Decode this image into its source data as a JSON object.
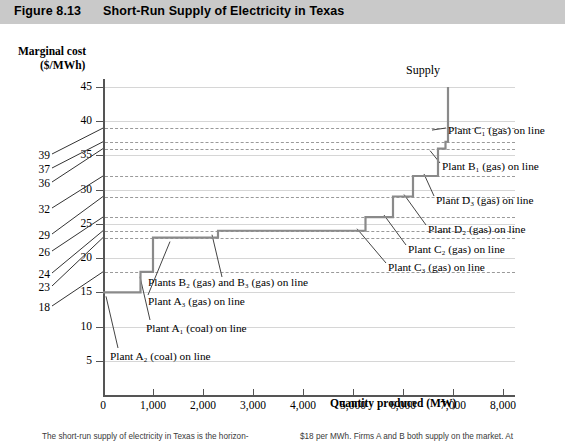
{
  "header": {
    "figure_number": "Figure 8.13",
    "title": "Short-Run Supply of Electricity in Texas"
  },
  "supply_label": "Supply",
  "caption": {
    "left": "The short-run supply of electricity in Texas is the horizon-",
    "right": "$18 per MWh. Firms A and B both supply on the market. At"
  },
  "chart_data": {
    "type": "line",
    "subtype": "step",
    "title": "Short-Run Supply of Electricity in Texas",
    "xlabel": "Quantity produced (MW)",
    "ylabel": "Marginal cost ($/MWh)",
    "xlim": [
      0,
      8000
    ],
    "ylim": [
      0,
      47
    ],
    "grid": true,
    "legend": "none",
    "x_ticks": [
      0,
      1000,
      2000,
      3000,
      4000,
      5000,
      6000,
      7000,
      8000
    ],
    "x_tick_labels": [
      "0",
      "1,000",
      "2,000",
      "3,000",
      "4,000",
      "5,000",
      "6,000",
      "7,000",
      "8,000"
    ],
    "y_ticks": [
      5,
      10,
      15,
      20,
      25,
      30,
      35,
      40,
      45
    ],
    "y_tick_labels": [
      "5",
      "10",
      "15",
      "20",
      "25",
      "30",
      "35",
      "40",
      "45"
    ],
    "y_reference_values": [
      18,
      23,
      24,
      26,
      29,
      32,
      36,
      37,
      39
    ],
    "y_reference_labels": [
      "18",
      "23",
      "24",
      "26",
      "29",
      "32",
      "36",
      "37",
      "39"
    ],
    "series": [
      {
        "name": "Supply",
        "steps": [
          {
            "q_start": 0,
            "q_end": 750,
            "price": 15
          },
          {
            "q_start": 750,
            "q_end": 1000,
            "price": 18
          },
          {
            "q_start": 1000,
            "q_end": 2300,
            "price": 23
          },
          {
            "q_start": 2300,
            "q_end": 5250,
            "price": 24
          },
          {
            "q_start": 5250,
            "q_end": 5800,
            "price": 26
          },
          {
            "q_start": 5800,
            "q_end": 6200,
            "price": 29
          },
          {
            "q_start": 6200,
            "q_end": 6700,
            "price": 32
          },
          {
            "q_start": 6700,
            "q_end": 6850,
            "price": 36
          },
          {
            "q_start": 6850,
            "q_end": 6900,
            "price": 37
          },
          {
            "q_start": 6900,
            "q_end": 6900,
            "price": 45
          }
        ]
      }
    ],
    "annotations": [
      {
        "id": "plant-a2",
        "text": "Plant A₂ (coal) on line",
        "plant": "A2",
        "fuel": "coal",
        "price": 15
      },
      {
        "id": "plant-a1",
        "text": "Plant A₁ (coal) on line",
        "plant": "A1",
        "fuel": "coal",
        "price": 18
      },
      {
        "id": "plant-a3",
        "text": "Plant A₃ (gas) on line",
        "plant": "A3",
        "fuel": "gas",
        "price": 23
      },
      {
        "id": "plant-b2-b3",
        "text": "Plants B₂ (gas) and B₃ (gas) on line",
        "plant": "B2,B3",
        "fuel": "gas",
        "price": 24
      },
      {
        "id": "plant-c3",
        "text": "Plant C₃ (gas) on line",
        "plant": "C3",
        "fuel": "gas",
        "price": 26
      },
      {
        "id": "plant-c2",
        "text": "Plant C₂ (gas) on line",
        "plant": "C2",
        "fuel": "gas",
        "price": 29
      },
      {
        "id": "plant-d2",
        "text": "Plant D₂ (gas) on line",
        "plant": "D2",
        "fuel": "gas",
        "price": 32
      },
      {
        "id": "plant-d3",
        "text": "Plant D₃ (gas) on line",
        "plant": "D3",
        "fuel": "gas",
        "price": 36
      },
      {
        "id": "plant-b1",
        "text": "Plant B₁ (gas) on line",
        "plant": "B1",
        "fuel": "gas",
        "price": 37
      },
      {
        "id": "plant-c1",
        "text": "Plant C₁ (gas) on line",
        "plant": "C1",
        "fuel": "gas",
        "price": 39
      }
    ]
  },
  "colors": {
    "header_bg": "#c9c9c9",
    "curve": "#8a8a8a",
    "grid": "#d6d6d6",
    "dashed_grid": "#9a9a9a",
    "axis": "#555555",
    "text": "#000000"
  }
}
